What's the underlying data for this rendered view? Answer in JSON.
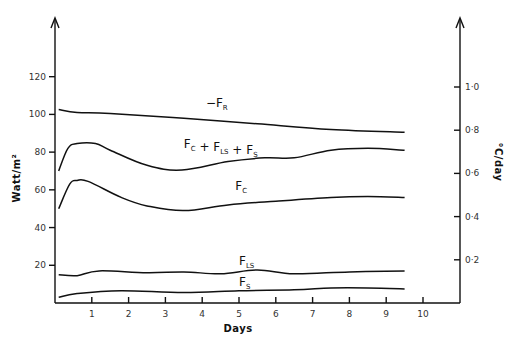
{
  "chart_data": {
    "type": "line",
    "title": "",
    "xlabel": "Days",
    "ylabel": "Watt/m²",
    "ylabel_right": "°C/day",
    "xlim": [
      0,
      10
    ],
    "ylim": [
      0,
      130
    ],
    "ylim_right": [
      0,
      1.1
    ],
    "x_ticks": [
      1,
      2,
      3,
      4,
      5,
      6,
      7,
      8,
      9,
      10
    ],
    "y_ticks": [
      20,
      40,
      60,
      80,
      100,
      120
    ],
    "y_ticks_right": [
      "0·2",
      "0·4",
      "0·6",
      "0·8",
      "1·0"
    ],
    "y_ticks_right_values": [
      0.2,
      0.4,
      0.6,
      0.8,
      1.0
    ],
    "grid": false,
    "legend": "inline labels",
    "series": [
      {
        "name": "-F_R",
        "label_main": "−F",
        "label_sub": "R",
        "label_pos": [
          4.1,
          104
        ],
        "x": [
          0.1,
          0.6,
          1.5,
          3.5,
          5.5,
          7.5,
          9.5
        ],
        "values": [
          102.6,
          101,
          100.5,
          98,
          95,
          92,
          90.5
        ]
      },
      {
        "name": "F_C + F_LS + F_S",
        "label_parts": [
          {
            "t": "F",
            "s": "C"
          },
          {
            "t": " + F",
            "s": "LS"
          },
          {
            "t": " + F",
            "s": "S"
          }
        ],
        "label_pos": [
          3.5,
          82
        ],
        "x": [
          0.1,
          0.35,
          0.6,
          1.1,
          1.5,
          2.5,
          3.45,
          4.7,
          5.7,
          6.5,
          7.5,
          8.5,
          9.5
        ],
        "values": [
          70,
          82,
          84.5,
          84.5,
          81,
          73,
          70.5,
          75,
          77,
          77,
          81,
          82,
          81
        ]
      },
      {
        "name": "F_C",
        "label_main": "F",
        "label_sub": "C",
        "label_pos": [
          4.9,
          60
        ],
        "x": [
          0.1,
          0.4,
          0.6,
          0.9,
          1.8,
          2.5,
          3.5,
          4.7,
          6,
          7.5,
          8.5,
          9.5
        ],
        "values": [
          50,
          63,
          65,
          64.5,
          56,
          51.5,
          49,
          52,
          54,
          56,
          56.5,
          56
        ]
      },
      {
        "name": "F_LS",
        "label_main": "F",
        "label_sub": "LS",
        "label_pos": [
          5.0,
          20
        ],
        "x": [
          0.1,
          0.6,
          1.2,
          2.5,
          3.5,
          4.5,
          5.5,
          6.5,
          8,
          9.5
        ],
        "values": [
          15,
          14.5,
          17,
          16,
          16.5,
          15.5,
          17.5,
          15.5,
          16.5,
          17
        ]
      },
      {
        "name": "F_S",
        "label_main": "F",
        "label_sub": "S",
        "label_pos": [
          5.0,
          9
        ],
        "x": [
          0.1,
          0.6,
          1.8,
          3.5,
          5,
          6.5,
          7.5,
          8.5,
          9.5
        ],
        "values": [
          3,
          5,
          6.5,
          5.5,
          6.5,
          7,
          8,
          8,
          7.5
        ]
      }
    ]
  }
}
